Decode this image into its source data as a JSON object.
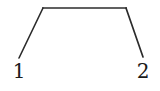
{
  "figure": {
    "background_color": "#ffffff",
    "stroke_color": "#2b2b2b",
    "label_color": "#1a1a1a",
    "labels": [
      {
        "name": "left-endpoint-label",
        "text": "1"
      },
      {
        "name": "right-endpoint-label",
        "text": "2"
      }
    ]
  },
  "chart_data": {
    "type": "line",
    "title": "",
    "subtitle": "",
    "xlabel": "",
    "ylabel": "",
    "grid": false,
    "legend": null,
    "xlim": [
      0,
      160
    ],
    "ylim": [
      0,
      91
    ],
    "categories": [
      "1",
      "2"
    ],
    "tick_labels": [
      "1",
      "2"
    ],
    "annotations": [],
    "series": [
      {
        "name": "left-leg",
        "points": [
          {
            "x": 19,
            "y": 58
          },
          {
            "x": 43,
            "y": 8
          }
        ]
      },
      {
        "name": "top-bar",
        "points": [
          {
            "x": 42,
            "y": 8
          },
          {
            "x": 127,
            "y": 8
          }
        ]
      },
      {
        "name": "right-leg",
        "points": [
          {
            "x": 126,
            "y": 8
          },
          {
            "x": 143,
            "y": 57
          }
        ]
      }
    ]
  }
}
